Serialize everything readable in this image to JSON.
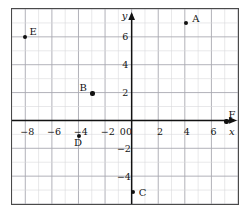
{
  "chart_data": {
    "type": "scatter",
    "title": "",
    "xlabel": "x",
    "ylabel": "y",
    "xlim": [
      -9,
      8
    ],
    "ylim": [
      -6,
      8
    ],
    "grid": true,
    "minor_grid_step": 1,
    "major_grid_step": 2,
    "legend": "none",
    "xticks": [
      -8,
      -6,
      -4,
      -2,
      0,
      2,
      4,
      6
    ],
    "xtick_labels": [
      "−8",
      "−6",
      "−4",
      "−2",
      "0",
      "2",
      "4",
      "6"
    ],
    "yticks": [
      6,
      4,
      2,
      -2,
      -4
    ],
    "ytick_labels": [
      "6",
      "4",
      "2",
      "−2",
      "−4"
    ],
    "points": [
      {
        "label": "A",
        "x": 4,
        "y": 7,
        "label_dx": 6,
        "label_dy": -9
      },
      {
        "label": "B",
        "x": -3,
        "y": 2,
        "label_dx": -13,
        "label_dy": -10
      },
      {
        "label": "C",
        "x": 0,
        "y": -5,
        "label_dx": 6,
        "label_dy": -4
      },
      {
        "label": "D",
        "x": -4,
        "y": -1,
        "label_dx": -5,
        "label_dy": 2
      },
      {
        "label": "E",
        "x": -8,
        "y": 6,
        "label_dx": 4,
        "label_dy": -10
      },
      {
        "label": "F",
        "x": 7,
        "y": 0,
        "label_dx": 2,
        "label_dy": -12
      }
    ]
  },
  "axes": {
    "x_axis_name": "x",
    "y_axis_name": "y",
    "origin_label": "0"
  },
  "colors": {
    "grid_minor": "#d8d8dc",
    "grid_major": "#a9a9b0",
    "axis": "#121212",
    "frame": "#4a4a4a",
    "point": "#111111",
    "text": "#141414"
  }
}
